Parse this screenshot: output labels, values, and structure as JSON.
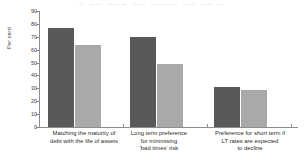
{
  "page_bleed_text": "—  ——  ———  ——  ————  ——  ——  —",
  "chart_data": {
    "type": "bar",
    "title": "",
    "xlabel": "",
    "ylabel": "Per cent",
    "ylim": [
      0,
      90
    ],
    "yticks": [
      0,
      10,
      20,
      30,
      40,
      50,
      60,
      70,
      80,
      90
    ],
    "ytick_labels": [
      "0",
      "10",
      "20",
      "30",
      "40",
      "50",
      "60",
      "70",
      "80",
      "90"
    ],
    "grid": false,
    "legend": "none",
    "categories": [
      "Matching the maturity of\ndebt with the life of assets",
      "Long term preference\nfor minimising\n'bad times' risk",
      "Preference for short term if\nLT rates are expected\nto decline"
    ],
    "series": [
      {
        "name": "Series 1",
        "color": "#595959",
        "values": [
          77,
          70,
          31
        ]
      },
      {
        "name": "Series 2",
        "color": "#a9a9a9",
        "values": [
          64,
          49,
          29
        ]
      }
    ]
  }
}
